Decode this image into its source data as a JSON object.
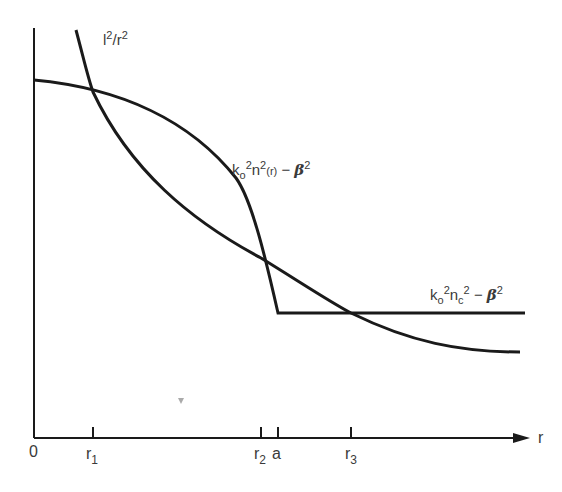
{
  "diagram": {
    "axes": {
      "x_label": "r",
      "origin_label": "0",
      "ticks": [
        {
          "id": "r1",
          "base": "r",
          "sub": "1"
        },
        {
          "id": "r2",
          "base": "r",
          "sub": "2"
        },
        {
          "id": "a",
          "base": "a",
          "sub": ""
        },
        {
          "id": "r3",
          "base": "r",
          "sub": "3"
        }
      ]
    },
    "curves": {
      "centrifugal": {
        "label_l": "l",
        "label_sup1": "2",
        "label_r": "/r",
        "label_sup2": "2"
      },
      "profile": {
        "k": "k",
        "k_sub": "o",
        "k_sup": "2",
        "n": "n",
        "n_sup": "2",
        "n_arg": "(r)",
        "minus": " − ",
        "beta": "β",
        "beta_sup": "2"
      },
      "cladding": {
        "k": "k",
        "k_sub": "o",
        "k_sup": "2",
        "n": "n",
        "n_sub": "c",
        "n_sup": "2",
        "minus": " − ",
        "beta": "β",
        "beta_sup": "2"
      }
    },
    "colors": {
      "stroke": "#1a1a1a",
      "text": "#3a3a3a",
      "background": "#ffffff"
    }
  }
}
